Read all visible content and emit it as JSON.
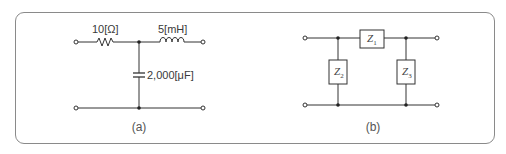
{
  "figure": {
    "panel_a": {
      "caption": "(a)",
      "resistor_label": "10[Ω]",
      "inductor_label": "5[mH]",
      "capacitor_label": "2,000[μF]"
    },
    "panel_b": {
      "caption": "(b)",
      "z1": {
        "main": "Z",
        "sub": "1"
      },
      "z2": {
        "main": "Z",
        "sub": "2"
      },
      "z3": {
        "main": "Z",
        "sub": "3"
      }
    },
    "colors": {
      "line": "#333333",
      "border": "#8a8a8a"
    }
  }
}
